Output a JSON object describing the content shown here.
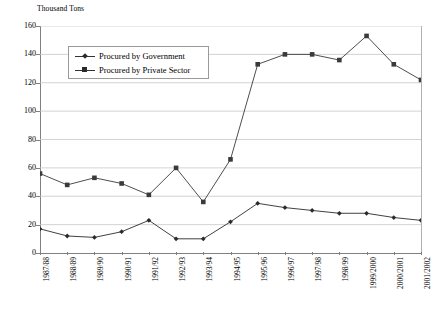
{
  "chart_data": {
    "type": "line",
    "title": "",
    "ylabel": "Thousand Tons",
    "xlabel": "",
    "ylim": [
      0,
      160
    ],
    "yticks": [
      0,
      20,
      40,
      60,
      80,
      100,
      120,
      140,
      160
    ],
    "grid": true,
    "legend_position": "top-left-inside",
    "categories": [
      "1987/88",
      "1988/89",
      "1989/90",
      "1990/91",
      "1991/92",
      "1992/93",
      "1993/94",
      "1994/95",
      "1995/96",
      "1996/97",
      "1997/98",
      "1998/99",
      "1999/2000",
      "2000/2001",
      "2001/2002"
    ],
    "series": [
      {
        "name": "Procured by Government",
        "marker": "diamond",
        "color": "#2b2b2b",
        "values": [
          17,
          12,
          11,
          15,
          23,
          10,
          10,
          22,
          35,
          32,
          30,
          28,
          28,
          25,
          23
        ]
      },
      {
        "name": "Procured by Private Sector",
        "marker": "square",
        "color": "#3a3a3a",
        "values": [
          56,
          48,
          53,
          49,
          41,
          60,
          36,
          66,
          133,
          140,
          140,
          136,
          153,
          133,
          122
        ]
      }
    ]
  },
  "legend": {
    "items": [
      {
        "label": "Procured by Government"
      },
      {
        "label": "Procured by Private Sector"
      }
    ]
  },
  "colors": {
    "grid": "#c8c8c8",
    "axis": "#808080",
    "series_government": "#2b2b2b",
    "series_private": "#3a3a3a",
    "background": "#ffffff"
  }
}
